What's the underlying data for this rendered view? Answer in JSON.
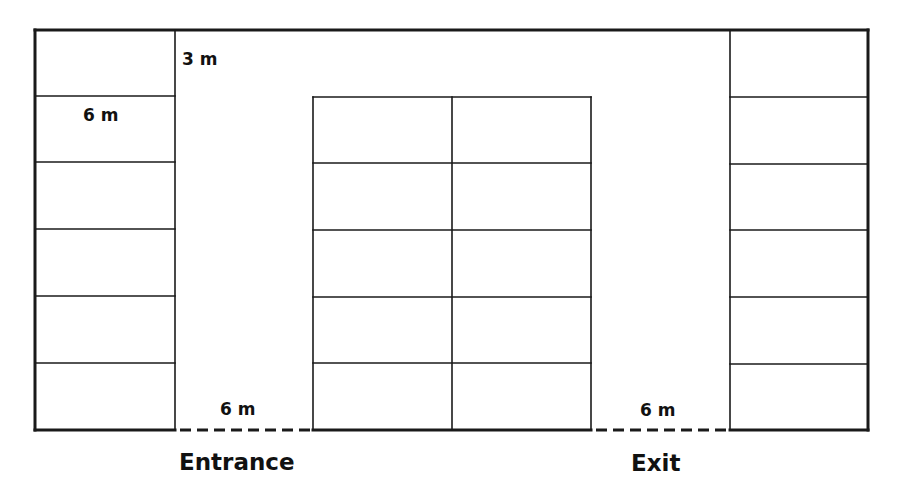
{
  "diagram": {
    "colors": {
      "line": "#1a1a1a",
      "background": "#ffffff",
      "text": "#111111"
    },
    "labels": {
      "aisle_width_top": "3 m",
      "space_length_left": "6 m",
      "entrance_width": "6 m",
      "exit_width": "6 m",
      "entrance": "Entrance",
      "exit": "Exit"
    },
    "sections": {
      "left_column": {
        "spaces": 6
      },
      "middle_block": {
        "columns": 2,
        "rows": 5,
        "spaces": 10
      },
      "right_column": {
        "spaces": 6
      }
    }
  }
}
